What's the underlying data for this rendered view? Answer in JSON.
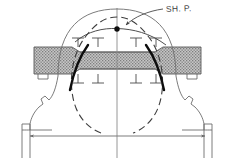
{
  "figure": {
    "title": "",
    "type": "engineering-section-drawing",
    "background_color": "#ffffff",
    "line_color": "#4a4a4a",
    "heavy_line_color": "#101010",
    "hatch_fill_color": "#b9b9b9",
    "hatch_dot_color": "#6f6f6f",
    "labels": [
      {
        "id": "shp",
        "text": "SH. P.",
        "meaning": "shear point / shoulder point annotation",
        "x": 166,
        "y": 4,
        "leader": "curved leader line with arrowhead pointing to marked node"
      }
    ],
    "markers": {
      "node_dot": {
        "name": "marked-point",
        "x": 117,
        "y": 29,
        "radius": 2.6,
        "color": "#101010"
      }
    },
    "tick_marks": {
      "upper_row_glyph": "T",
      "upper_row_count": 4,
      "upper_row_x": [
        78,
        98,
        136,
        156
      ],
      "upper_row_y": 47,
      "lower_row_glyph": "⊥",
      "lower_row_count": 4,
      "lower_row_x": [
        78,
        98,
        136,
        156
      ],
      "lower_row_y": 73
    },
    "centerline": {
      "name": "vertical-centerline",
      "x": 117,
      "y_top": 8,
      "y_bottom": 158
    },
    "baseline": {
      "name": "baseline-dimension-line",
      "y": 136,
      "x_left": 30,
      "x_right": 210,
      "arrowheads": "both-ends"
    },
    "hatched_member": {
      "name": "hatched-tie-member",
      "x_left": 34,
      "x_right": 201,
      "y_top": 47,
      "y_bottom": 74
    },
    "curves": {
      "outer_arch": "solid thin arc spanning springing points over the crown",
      "inner_arch": "thin arc passing through the marked point",
      "dashed_profile": "long-dashed intrados profile curve",
      "heavy_segments": "two short heavy black curve segments at the haunches"
    }
  }
}
